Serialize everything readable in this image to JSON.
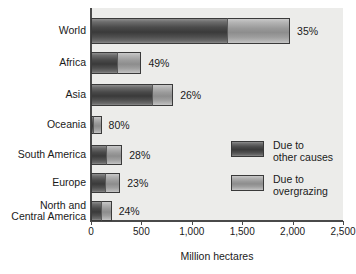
{
  "chart_data": {
    "type": "bar",
    "orientation": "horizontal",
    "stacked": true,
    "title": "",
    "xlabel": "Million hectares",
    "ylabel": "",
    "xlim": [
      0,
      2500
    ],
    "grid": false,
    "legend_position": "inside-right",
    "xticks": [
      0,
      500,
      1000,
      1500,
      2000,
      2500
    ],
    "xtick_labels": [
      "0",
      "500",
      "1,000",
      "1,500",
      "2,000",
      "2,500"
    ],
    "categories": [
      "World",
      "Africa",
      "Asia",
      "Oceania",
      "South America",
      "Europe",
      "North and\nCentral America"
    ],
    "series": [
      {
        "name": "Due to\nother causes",
        "key": "other",
        "values": [
          1350,
          255,
          605,
          20,
          145,
          135,
          100
        ]
      },
      {
        "name": "Due to\novergrazing",
        "key": "overgrazing",
        "values": [
          625,
          245,
          210,
          85,
          165,
          155,
          105
        ]
      }
    ],
    "totals": [
      1975,
      500,
      815,
      105,
      310,
      290,
      205
    ],
    "annotations": [
      "35%",
      "49%",
      "26%",
      "80%",
      "28%",
      "23%",
      "24%"
    ]
  },
  "legend": {
    "entries": [
      {
        "label": "Due to\nother causes",
        "color": "#4a4a4a"
      },
      {
        "label": "Due to\novergrazing",
        "color": "#9a9a9a"
      }
    ]
  },
  "colors": {
    "other_causes": "#4a4a4a",
    "overgrazing": "#9a9a9a",
    "panel_background": "#ececea",
    "axis": "#4a4a4a",
    "text": "#1a1a1a"
  }
}
